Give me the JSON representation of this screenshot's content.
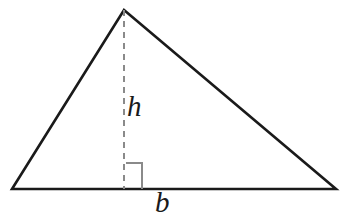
{
  "figure": {
    "name": "triangle-base-height-diagram",
    "background_color": "#ffffff",
    "stroke_color": "#1a1a1a",
    "guide_color": "#8a8a8a",
    "stroke_width": 2.6,
    "guide_width": 2.0,
    "dash_pattern": "6 5",
    "vertices": {
      "apex": {
        "x": 124,
        "y": 10
      },
      "bottom_left": {
        "x": 12,
        "y": 189
      },
      "bottom_right": {
        "x": 336,
        "y": 189
      }
    },
    "altitude": {
      "name": "height-dashed-line",
      "from": {
        "x": 124,
        "y": 10
      },
      "to": {
        "x": 124,
        "y": 189
      }
    },
    "right_angle_marker": {
      "name": "right-angle-square",
      "x": 126,
      "y": 163,
      "size": 16,
      "points": "126,163 142,163 142,189"
    },
    "labels": {
      "height": {
        "text": "h",
        "x": 136,
        "y": 107
      },
      "base": {
        "text": "b",
        "x": 164,
        "y": 202
      }
    }
  }
}
